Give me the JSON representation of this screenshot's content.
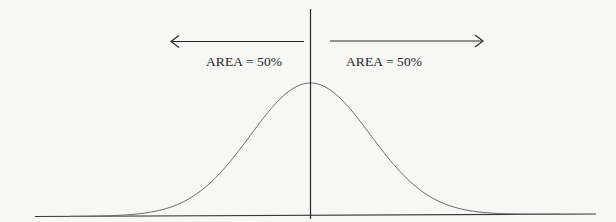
{
  "diagram": {
    "type": "normal-distribution",
    "labels": {
      "left_area": "AREA = 50%",
      "right_area": "AREA = 50%"
    },
    "arrows": {
      "left": "arrow-left",
      "right": "arrow-right"
    },
    "colors": {
      "background": "#f7f7f5",
      "lines": "#2a2a2a",
      "curve": "#6a6a6a",
      "text": "#1e1e1e"
    }
  }
}
